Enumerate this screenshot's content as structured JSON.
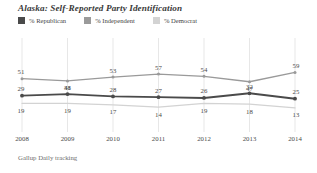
{
  "chart_title": "Alaska: Self-Reported Party Identification",
  "footer": "Gallup Daily tracking",
  "legend": {
    "position": "top-left",
    "items": [
      {
        "label": "% Republican",
        "color": "#4a4a4a",
        "swatch_name": "legend-swatch-republican"
      },
      {
        "label": "% Independent",
        "color": "#9a9a9a",
        "swatch_name": "legend-swatch-independent"
      },
      {
        "label": "% Democrat",
        "color": "#d3d3d3",
        "swatch_name": "legend-swatch-democrat"
      }
    ]
  },
  "axis": {
    "x_ticks": [
      "2008",
      "2009",
      "2010",
      "2011",
      "2012",
      "2013",
      "2014"
    ]
  },
  "chart_data": {
    "type": "line",
    "title": "Alaska: Self-Reported Party Identification",
    "subtitle": "",
    "xlabel": "",
    "ylabel": "",
    "x": [
      "2008",
      "2009",
      "2010",
      "2011",
      "2012",
      "2013",
      "2014"
    ],
    "categories": [
      "2008",
      "2009",
      "2010",
      "2011",
      "2012",
      "2013",
      "2014"
    ],
    "series": [
      {
        "name": "% Republican",
        "color": "#4a4a4a",
        "values": [
          29,
          31,
          28,
          27,
          26,
          32,
          25
        ],
        "label_offsets": [
          "above",
          "above",
          "above",
          "above",
          "above",
          "above",
          "above"
        ]
      },
      {
        "name": "% Independent",
        "color": "#9a9a9a",
        "values": [
          51,
          48,
          53,
          57,
          54,
          47,
          59
        ],
        "label_offsets": [
          "above",
          "below",
          "above",
          "above",
          "above",
          "below",
          "above"
        ]
      },
      {
        "name": "% Democrat",
        "color": "#d3d3d3",
        "values": [
          19,
          19,
          17,
          14,
          19,
          18,
          13
        ],
        "label_offsets": [
          "below",
          "below",
          "below",
          "below",
          "below",
          "below",
          "below"
        ]
      }
    ],
    "ylim": [
      0,
      70
    ],
    "grid": "vertical-only",
    "legend_position": "top-left",
    "source": "Gallup Daily tracking"
  }
}
